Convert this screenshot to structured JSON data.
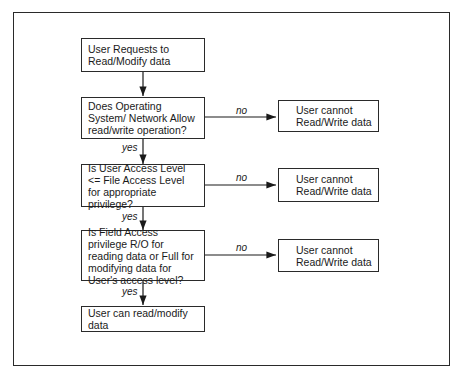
{
  "diagram": {
    "type": "flowchart",
    "nodes": {
      "start": "User Requests to Read/Modify data",
      "q1": "Does Operating System/ Network Allow read/write operation?",
      "q2": "Is User Access Level <= File Access Level for appropriate privilege?",
      "q3": "Is Field Access privilege R/O for reading data or Full for modifying data for User's access level?",
      "deny1": "User cannot Read/Write data",
      "deny2": "User cannot Read/Write data",
      "deny3": "User cannot Read/Write data",
      "end": "User can read/modify data"
    },
    "edges": [
      {
        "from": "start",
        "to": "q1",
        "label": ""
      },
      {
        "from": "q1",
        "to": "deny1",
        "label": "no"
      },
      {
        "from": "q1",
        "to": "q2",
        "label": "yes"
      },
      {
        "from": "q2",
        "to": "deny2",
        "label": "no"
      },
      {
        "from": "q2",
        "to": "q3",
        "label": "yes"
      },
      {
        "from": "q3",
        "to": "deny3",
        "label": "no"
      },
      {
        "from": "q3",
        "to": "end",
        "label": "yes"
      }
    ],
    "labels": {
      "no1": "no",
      "no2": "no",
      "no3": "no",
      "yes1": "yes",
      "yes2": "yes",
      "yes3": "yes"
    }
  }
}
